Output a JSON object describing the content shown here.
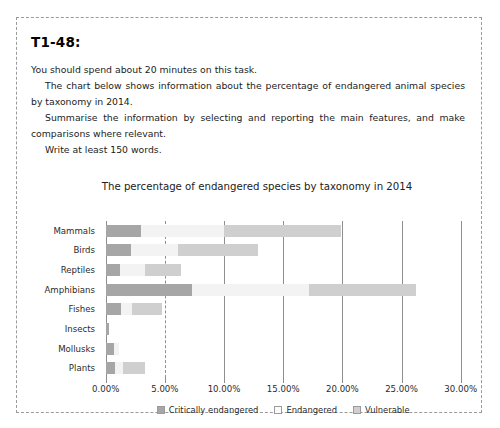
{
  "task": {
    "title": "T1-48:",
    "lines": [
      "You should spend about 20 minutes on this task.",
      "The chart below shows information about the percentage of endangered animal species by taxonomy in 2014.",
      "Summarise the information by selecting and reporting the main features, and make comparisons where relevant.",
      "Write at least 150 words."
    ]
  },
  "chart_data": {
    "type": "bar",
    "orientation": "horizontal",
    "stacked": true,
    "title": "The percentage of endangered species by taxonomy in 2014",
    "xlabel": "",
    "ylabel": "",
    "xlim": [
      0,
      30
    ],
    "xticks": [
      "0.00%",
      "5.00%",
      "10.00%",
      "15.00%",
      "20.00%",
      "25.00%",
      "30.00%"
    ],
    "xtick_values": [
      0,
      5,
      10,
      15,
      20,
      25,
      30
    ],
    "grid": true,
    "legend_position": "bottom",
    "categories": [
      "Mammals",
      "Birds",
      "Reptiles",
      "Amphibians",
      "Fishes",
      "Insects",
      "Mollusks",
      "Plants"
    ],
    "series": [
      {
        "name": "Critically endangered",
        "color": "#a6a6a6",
        "values": [
          3.0,
          2.1,
          1.2,
          7.3,
          1.3,
          0.3,
          0.7,
          0.8
        ]
      },
      {
        "name": "Endangered",
        "color": "#f3f3f3",
        "values": [
          7.0,
          4.0,
          2.1,
          9.9,
          0.9,
          0.0,
          0.4,
          0.7
        ]
      },
      {
        "name": "Vulnerable",
        "color": "#cfcfcf",
        "values": [
          9.9,
          6.8,
          3.1,
          9.0,
          2.6,
          0.0,
          0.0,
          1.8
        ]
      }
    ]
  },
  "legend": [
    {
      "label": "Critically endangered",
      "swatch": "crit"
    },
    {
      "label": "Endangered",
      "swatch": "endg"
    },
    {
      "label": "Vulnerable",
      "swatch": "vuln"
    }
  ]
}
